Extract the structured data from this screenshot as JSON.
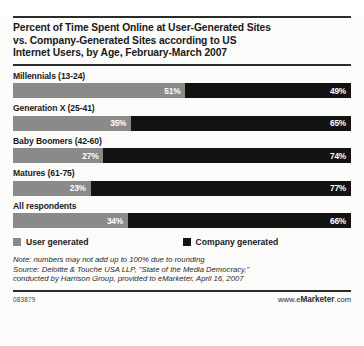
{
  "chart_data": {
    "type": "bar",
    "orientation": "horizontal-stacked",
    "title": "Percent of Time Spent Online at User-Generated Sites vs. Company-Generated Sites according to US Internet Users, by Age, February-March 2007",
    "xlabel": "",
    "ylabel": "",
    "xlim": [
      0,
      100
    ],
    "grid": false,
    "legend_position": "below-plot",
    "categories": [
      "Millennials (13-24)",
      "Generation X (25-41)",
      "Baby Boomers (42-60)",
      "Matures (61-75)",
      "All respondents"
    ],
    "series": [
      {
        "name": "User generated",
        "color": "#8a8a8a",
        "values": [
          51,
          35,
          27,
          23,
          34
        ]
      },
      {
        "name": "Company generated",
        "color": "#131313",
        "values": [
          49,
          65,
          74,
          77,
          66
        ]
      }
    ]
  },
  "title": {
    "line1": "Percent of Time Spent Online at User-Generated Sites",
    "line2": "vs. Company-Generated Sites according to US",
    "line3": "Internet Users, by Age, February-March 2007"
  },
  "groups": [
    {
      "label": "Millennials (13-24)",
      "user": 51,
      "company": 49,
      "user_text": "51%",
      "company_text": "49%"
    },
    {
      "label": "Generation X (25-41)",
      "user": 35,
      "company": 65,
      "user_text": "35%",
      "company_text": "65%"
    },
    {
      "label": "Baby Boomers (42-60)",
      "user": 27,
      "company": 74,
      "user_text": "27%",
      "company_text": "74%"
    },
    {
      "label": "Matures (61-75)",
      "user": 23,
      "company": 77,
      "user_text": "23%",
      "company_text": "77%"
    },
    {
      "label": "All respondents",
      "user": 34,
      "company": 66,
      "user_text": "34%",
      "company_text": "66%"
    }
  ],
  "legend": {
    "user_label": "User generated",
    "company_label": "Company generated"
  },
  "note": {
    "line1": "Note: numbers may not add up to 100% due to rounding",
    "line2": "Source: Deloitte & Touche USA LLP, \"State of the Media Democracy,\"",
    "line3": "conducted by Harrison Group, provided to eMarketer, April 16, 2007"
  },
  "footer": {
    "chart_id": "083879",
    "brand_prefix": "www.e",
    "brand_bold": "Marketer",
    "brand_suffix": ".com"
  },
  "colors": {
    "user_generated": "#8a8a8a",
    "company_generated": "#131313",
    "rule": "#2b2b2b"
  }
}
